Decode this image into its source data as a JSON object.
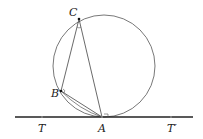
{
  "diagram": {
    "labels": {
      "C": "C",
      "B": "B",
      "A": "A",
      "T": "T",
      "T_prime": "T′"
    },
    "points": {
      "A": [
        102,
        117
      ],
      "B": [
        61,
        91
      ],
      "C": [
        79,
        19
      ],
      "T": [
        42,
        117
      ],
      "T_prime": [
        171,
        117
      ]
    },
    "circle": {
      "cx": 104,
      "cy": 66,
      "r": 51
    },
    "tangent_line": {
      "x1": 15,
      "y1": 117,
      "x2": 193,
      "y2": 117
    },
    "colors": {
      "stroke": "#444444",
      "line": "#222222"
    }
  }
}
